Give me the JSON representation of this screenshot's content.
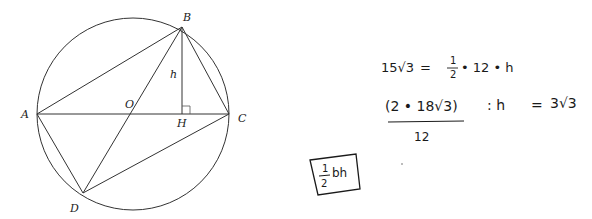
{
  "diagram": {
    "points": {
      "A": {
        "label": "A",
        "x": 37,
        "y": 114
      },
      "B": {
        "label": "B",
        "x": 182,
        "y": 27
      },
      "C": {
        "label": "C",
        "x": 229,
        "y": 114
      },
      "D": {
        "label": "D",
        "x": 83,
        "y": 193
      },
      "O": {
        "label": "O",
        "x": 132,
        "y": 114
      },
      "H": {
        "label": "H",
        "x": 182,
        "y": 114
      }
    },
    "height_label": "h",
    "circle": {
      "cx": 133,
      "cy": 114,
      "r": 96
    }
  },
  "notes": {
    "line1_left": "15√3",
    "line1_eq": "=",
    "line1_frac_num": "1",
    "line1_frac_den": "2",
    "line1_rest": "• 12 • h",
    "line2_num": "(2 • 18√3)",
    "line2_den": "12",
    "line2_mid": ": h",
    "line2_eq": "=",
    "line2_result": "3√3",
    "boxed_frac_num": "1",
    "boxed_frac_den": "2",
    "boxed_rest": "bh"
  }
}
